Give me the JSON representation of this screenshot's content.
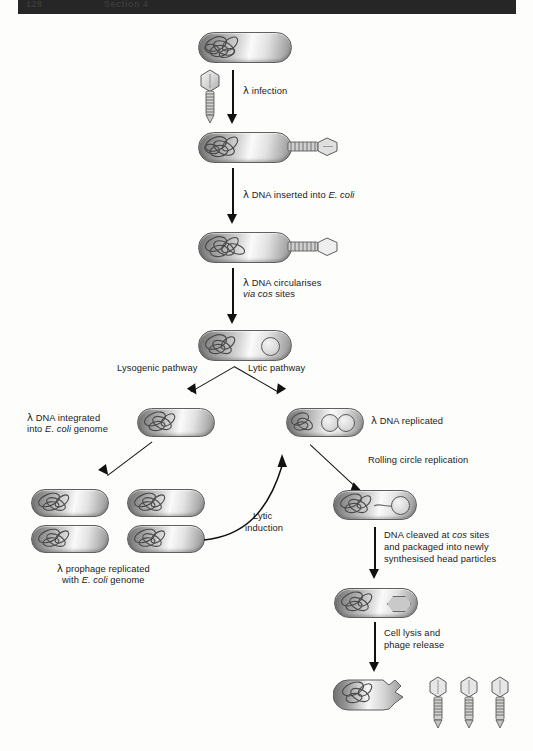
{
  "header": {
    "left_text": "128",
    "right_text": "Section 4"
  },
  "figure": {
    "steps": {
      "infection": "λ infection",
      "dna_inserted": "λ DNA inserted into E. coli",
      "circularises_line1": "λ DNA circularises",
      "circularises_line2": "via cos sites",
      "lysogenic_pathway": "Lysogenic pathway",
      "lytic_pathway": "Lytic pathway",
      "dna_integrated_line1": "λ DNA integrated",
      "dna_integrated_line2": "into E. coli genome",
      "dna_replicated": "λ DNA replicated",
      "rolling_circle": "Rolling circle replication",
      "prophage_line1": "λ prophage replicated",
      "prophage_line2": "with E. coli genome",
      "lytic_induction_line1": "Lytic",
      "lytic_induction_line2": "induction",
      "cleaved_line1": "DNA cleaved at cos sites",
      "cleaved_line2": "and packaged into newly",
      "cleaved_line3": "synthesised head particles",
      "cell_lysis_line1": "Cell lysis and",
      "cell_lysis_line2": "phage release"
    },
    "italic_fragments": {
      "e_coli": "E. coli",
      "via": "via",
      "cos": "cos"
    },
    "counts": {
      "prophage_cells": 4,
      "released_phages": 3,
      "replicated_plasmids": 2
    },
    "colors": {
      "ink": "#111111",
      "cell_outline": "#5f5f5f",
      "header_bar": "#262626",
      "page_background": "#fdfdfc"
    }
  }
}
